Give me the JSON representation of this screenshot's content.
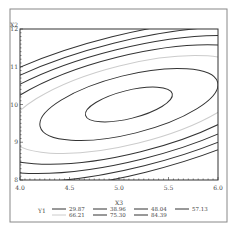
{
  "chart_data": {
    "type": "contour",
    "title": "",
    "xlabel": "X3",
    "ylabel": "X2",
    "xlim": [
      4.0,
      6.0
    ],
    "ylim": [
      8,
      12
    ],
    "x_ticks": [
      "4.0",
      "4.5",
      "5.0",
      "5.5",
      "6.0"
    ],
    "y_ticks": [
      "8",
      "9",
      "10",
      "11",
      "12"
    ],
    "grid": false,
    "legend": {
      "title": "Y1",
      "position": "bottom",
      "entries": [
        {
          "label": "29.87",
          "color": "#333333"
        },
        {
          "label": "38.96",
          "color": "#333333"
        },
        {
          "label": "48.04",
          "color": "#333333"
        },
        {
          "label": "57.13",
          "color": "#333333"
        },
        {
          "label": "66.21",
          "color": "#cccccc"
        },
        {
          "label": "75.30",
          "color": "#333333"
        },
        {
          "label": "84.39",
          "color": "#333333"
        }
      ]
    },
    "contours": [
      {
        "level": 84.39,
        "center": [
          5.1,
          10.0
        ],
        "rx": 0.43,
        "ry": 0.6,
        "color": "#333333"
      },
      {
        "level": 75.3,
        "center": [
          5.1,
          10.0
        ],
        "rx": 0.88,
        "ry": 1.25,
        "color": "#333333"
      },
      {
        "level": 66.21,
        "center": [
          5.1,
          10.0
        ],
        "rx": 1.2,
        "ry": 1.7,
        "color": "#cccccc"
      },
      {
        "level": 57.13,
        "center": [
          5.1,
          10.0
        ],
        "rx": 1.45,
        "ry": 2.08,
        "color": "#333333"
      },
      {
        "level": 48.04,
        "center": [
          5.1,
          10.0
        ],
        "rx": 1.68,
        "ry": 2.4,
        "color": "#333333"
      },
      {
        "level": 38.96,
        "center": [
          5.1,
          10.0
        ],
        "rx": 1.88,
        "ry": 2.7,
        "color": "#333333"
      },
      {
        "level": 29.87,
        "center": [
          5.1,
          10.0
        ],
        "rx": 2.06,
        "ry": 2.98,
        "color": "#333333"
      }
    ]
  }
}
